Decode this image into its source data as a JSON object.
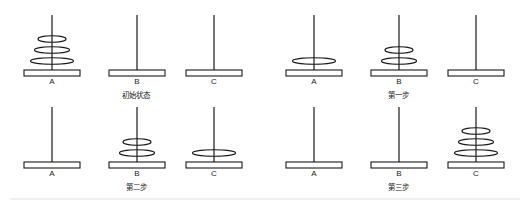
{
  "colors": {
    "stroke": "#1a1a1a",
    "background": "#ffffff",
    "divider": "#e2e2e2"
  },
  "peg_labels": [
    "A",
    "B",
    "C"
  ],
  "disk_sizes": {
    "small": 28,
    "medium": 35,
    "large": 43
  },
  "panels": [
    {
      "id": "initial",
      "caption": "初始状态",
      "origin": {
        "x": 0,
        "y": 0
      },
      "pegs": [
        {
          "label": "A",
          "x": 52,
          "disks": [
            "large",
            "medium",
            "small"
          ]
        },
        {
          "label": "B",
          "x": 137,
          "disks": []
        },
        {
          "label": "C",
          "x": 214,
          "disks": []
        }
      ]
    },
    {
      "id": "step1",
      "caption": "第一步",
      "origin": {
        "x": 262,
        "y": 0
      },
      "pegs": [
        {
          "label": "A",
          "x": 52,
          "disks": [
            "large"
          ]
        },
        {
          "label": "B",
          "x": 137,
          "disks": [
            "medium",
            "small"
          ]
        },
        {
          "label": "C",
          "x": 214,
          "disks": []
        }
      ]
    },
    {
      "id": "step2",
      "caption": "第二步",
      "origin": {
        "x": 0,
        "y": 92
      },
      "pegs": [
        {
          "label": "A",
          "x": 52,
          "disks": []
        },
        {
          "label": "B",
          "x": 137,
          "disks": [
            "medium",
            "small"
          ]
        },
        {
          "label": "C",
          "x": 214,
          "disks": [
            "large"
          ]
        }
      ]
    },
    {
      "id": "step3",
      "caption": "第三步",
      "origin": {
        "x": 262,
        "y": 92
      },
      "pegs": [
        {
          "label": "A",
          "x": 52,
          "disks": []
        },
        {
          "label": "B",
          "x": 137,
          "disks": []
        },
        {
          "label": "C",
          "x": 214,
          "disks": [
            "large",
            "medium",
            "small"
          ]
        }
      ]
    }
  ]
}
